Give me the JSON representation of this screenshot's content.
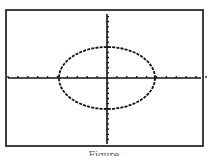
{
  "chart_data": {
    "type": "line",
    "title": "",
    "xlabel": "",
    "ylabel": "",
    "xlim": [
      -10,
      10
    ],
    "ylim": [
      -10,
      10
    ],
    "grid": false,
    "series": [
      {
        "name": "ellipse",
        "shape": "ellipse",
        "center": [
          0,
          0
        ],
        "semi_major_x": 5,
        "semi_minor_y": 5
      }
    ],
    "x_ticks_count_each_side": 10,
    "y_ticks_count_each_side": 10
  },
  "caption": "Figure"
}
